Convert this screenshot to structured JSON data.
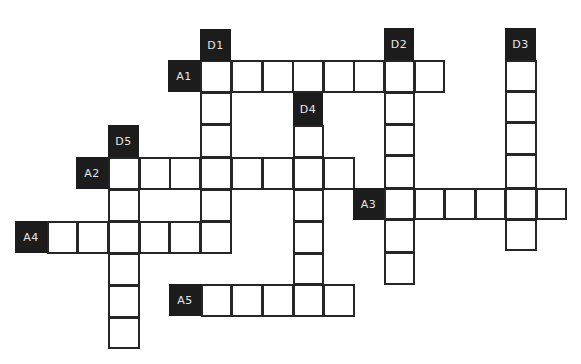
{
  "puzzle": {
    "type": "crossword",
    "colors": {
      "label_bg": "#1c1c1c",
      "label_text": "#e6e6e6",
      "cell_border": "#262626",
      "cell_bg": "#ffffff"
    },
    "labels": [
      {
        "id": "D1",
        "text": "D1",
        "x": 200,
        "y": 29,
        "w": 31,
        "h": 32
      },
      {
        "id": "D2",
        "text": "D2",
        "x": 384,
        "y": 28,
        "w": 30,
        "h": 32
      },
      {
        "id": "D3",
        "text": "D3",
        "x": 505,
        "y": 28,
        "w": 31,
        "h": 32
      },
      {
        "id": "A1",
        "text": "A1",
        "x": 168,
        "y": 60,
        "w": 32,
        "h": 32
      },
      {
        "id": "D4",
        "text": "D4",
        "x": 293,
        "y": 93,
        "w": 30,
        "h": 32
      },
      {
        "id": "D5",
        "text": "D5",
        "x": 108,
        "y": 125,
        "w": 31,
        "h": 32
      },
      {
        "id": "A2",
        "text": "A2",
        "x": 76,
        "y": 157,
        "w": 32,
        "h": 32
      },
      {
        "id": "A3",
        "text": "A3",
        "x": 353,
        "y": 188,
        "w": 31,
        "h": 32
      },
      {
        "id": "A4",
        "text": "A4",
        "x": 15,
        "y": 221,
        "w": 32,
        "h": 32
      },
      {
        "id": "A5",
        "text": "A5",
        "x": 169,
        "y": 284,
        "w": 32,
        "h": 32
      }
    ],
    "clues": {
      "across": [
        {
          "id": "A1",
          "length": 8
        },
        {
          "id": "A2",
          "length": 8
        },
        {
          "id": "A3",
          "length": 6
        },
        {
          "id": "A4",
          "length": 6
        },
        {
          "id": "A5",
          "length": 5
        }
      ],
      "down": [
        {
          "id": "D1",
          "length": 6
        },
        {
          "id": "D2",
          "length": 7
        },
        {
          "id": "D3",
          "length": 6
        },
        {
          "id": "D4",
          "length": 6
        },
        {
          "id": "D5",
          "length": 6
        }
      ]
    },
    "cells": [
      [
        200,
        60,
        32,
        33
      ],
      [
        231,
        60,
        32,
        33
      ],
      [
        262,
        60,
        32,
        33
      ],
      [
        292,
        60,
        32,
        33
      ],
      [
        323,
        60,
        32,
        33
      ],
      [
        353,
        60,
        32,
        33
      ],
      [
        384,
        60,
        31,
        33
      ],
      [
        414,
        60,
        31,
        33
      ],
      [
        200,
        92,
        32,
        33
      ],
      [
        384,
        92,
        31,
        33
      ],
      [
        293,
        125,
        31,
        33
      ],
      [
        200,
        124,
        32,
        34
      ],
      [
        384,
        124,
        31,
        32
      ],
      [
        108,
        157,
        32,
        33
      ],
      [
        139,
        157,
        32,
        33
      ],
      [
        169,
        157,
        32,
        33
      ],
      [
        200,
        157,
        32,
        33
      ],
      [
        231,
        157,
        32,
        33
      ],
      [
        262,
        157,
        32,
        33
      ],
      [
        293,
        157,
        31,
        33
      ],
      [
        323,
        157,
        32,
        33
      ],
      [
        384,
        155,
        31,
        34
      ],
      [
        108,
        189,
        32,
        33
      ],
      [
        200,
        189,
        32,
        33
      ],
      [
        293,
        189,
        31,
        33
      ],
      [
        384,
        188,
        31,
        32
      ],
      [
        414,
        188,
        31,
        32
      ],
      [
        444,
        188,
        32,
        32
      ],
      [
        475,
        188,
        31,
        32
      ],
      [
        505,
        188,
        32,
        32
      ],
      [
        536,
        188,
        31,
        32
      ],
      [
        47,
        221,
        31,
        33
      ],
      [
        77,
        221,
        32,
        33
      ],
      [
        108,
        221,
        32,
        33
      ],
      [
        139,
        221,
        31,
        33
      ],
      [
        169,
        221,
        32,
        33
      ],
      [
        200,
        221,
        32,
        33
      ],
      [
        293,
        221,
        31,
        33
      ],
      [
        384,
        219,
        31,
        34
      ],
      [
        505,
        219,
        32,
        32
      ],
      [
        108,
        253,
        32,
        33
      ],
      [
        293,
        253,
        31,
        32
      ],
      [
        384,
        252,
        31,
        33
      ],
      [
        201,
        284,
        31,
        33
      ],
      [
        231,
        284,
        32,
        33
      ],
      [
        262,
        284,
        32,
        33
      ],
      [
        293,
        284,
        31,
        33
      ],
      [
        323,
        284,
        32,
        33
      ],
      [
        108,
        285,
        32,
        33
      ],
      [
        108,
        317,
        32,
        32
      ],
      [
        505,
        60,
        32,
        32
      ],
      [
        505,
        91,
        32,
        32
      ],
      [
        505,
        122,
        32,
        33
      ],
      [
        505,
        154,
        32,
        35
      ]
    ]
  }
}
